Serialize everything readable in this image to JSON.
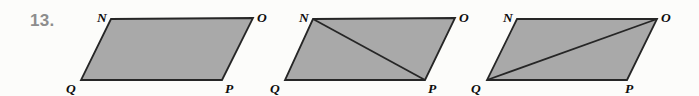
{
  "figure": {
    "width": 699,
    "height": 96,
    "background_color": "#fcfcfa",
    "problem_number": "13.",
    "problem_number_color": "#8d8d8d",
    "shape_fill_color": "#a9a9a9",
    "shape_stroke_color": "#262626",
    "label_color": "#0d0d0d"
  },
  "shapes": [
    {
      "name": "parallelogram-1",
      "label": "NOPQ",
      "points": "111,19 253,18 222,80 81,80",
      "diagonal": null,
      "vertices": [
        {
          "key": "N",
          "text": "N",
          "x": 97,
          "y": 22
        },
        {
          "key": "O",
          "text": "O",
          "x": 257,
          "y": 22
        },
        {
          "key": "P",
          "text": "P",
          "x": 225,
          "y": 93
        },
        {
          "key": "Q",
          "text": "Q",
          "x": 66,
          "y": 93
        }
      ]
    },
    {
      "name": "parallelogram-2",
      "label": "NOPQ",
      "points": "313,19 455,18 425,80 285,80",
      "diagonal": {
        "from": "N",
        "to": "P",
        "path": "M 313 19 L 425 80"
      },
      "vertices": [
        {
          "key": "N",
          "text": "N",
          "x": 299,
          "y": 22
        },
        {
          "key": "O",
          "text": "O",
          "x": 459,
          "y": 22
        },
        {
          "key": "P",
          "text": "P",
          "x": 428,
          "y": 93
        },
        {
          "key": "Q",
          "text": "Q",
          "x": 270,
          "y": 93
        }
      ]
    },
    {
      "name": "parallelogram-3",
      "label": "NOPQ",
      "points": "517,19 657,19 627,80 487,80",
      "diagonal": {
        "from": "Q",
        "to": "O",
        "path": "M 487 80 L 657 19"
      },
      "vertices": [
        {
          "key": "N",
          "text": "N",
          "x": 503,
          "y": 22
        },
        {
          "key": "O",
          "text": "O",
          "x": 661,
          "y": 22
        },
        {
          "key": "P",
          "text": "P",
          "x": 625,
          "y": 93
        },
        {
          "key": "Q",
          "text": "Q",
          "x": 471,
          "y": 93
        }
      ]
    }
  ]
}
